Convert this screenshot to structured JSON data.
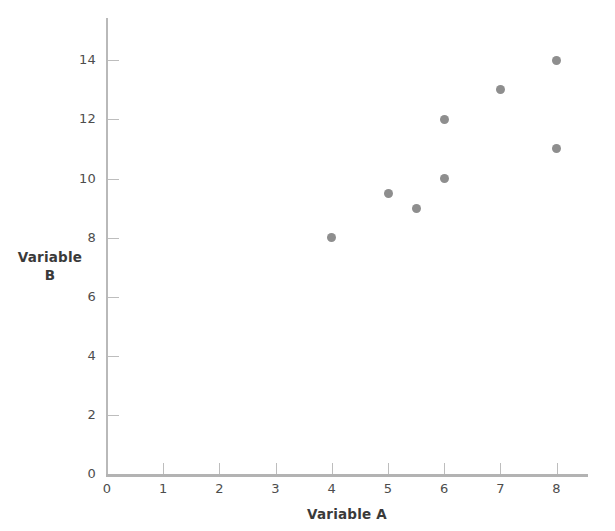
{
  "chart_data": {
    "type": "scatter",
    "title": "",
    "xlabel": "Variable A",
    "ylabel": "Variable B",
    "ylabel_lines": [
      "Variable",
      "B"
    ],
    "xlim": [
      0,
      8.6
    ],
    "ylim": [
      0,
      15.5
    ],
    "xticks": [
      0,
      1,
      2,
      3,
      4,
      5,
      6,
      7,
      8
    ],
    "xtick_labels": [
      "0",
      "1",
      "2",
      "3",
      "4",
      "5",
      "6",
      "7",
      "8"
    ],
    "yticks": [
      0,
      2,
      4,
      6,
      8,
      10,
      12,
      14
    ],
    "ytick_labels": [
      "0",
      "2",
      "4",
      "6",
      "8",
      "10",
      "12",
      "14"
    ],
    "grid": false,
    "legend": false,
    "marker": "filled-circle",
    "marker_color": "#8e8e8e",
    "axis_color": "#b9b9b9",
    "text_color": "#4d4d4d",
    "background": "#ffffff",
    "points": [
      {
        "x": 4,
        "y": 8
      },
      {
        "x": 5,
        "y": 9.5
      },
      {
        "x": 5.5,
        "y": 9
      },
      {
        "x": 6,
        "y": 10
      },
      {
        "x": 6,
        "y": 12
      },
      {
        "x": 7,
        "y": 13
      },
      {
        "x": 8,
        "y": 11
      },
      {
        "x": 8,
        "y": 14
      }
    ]
  }
}
